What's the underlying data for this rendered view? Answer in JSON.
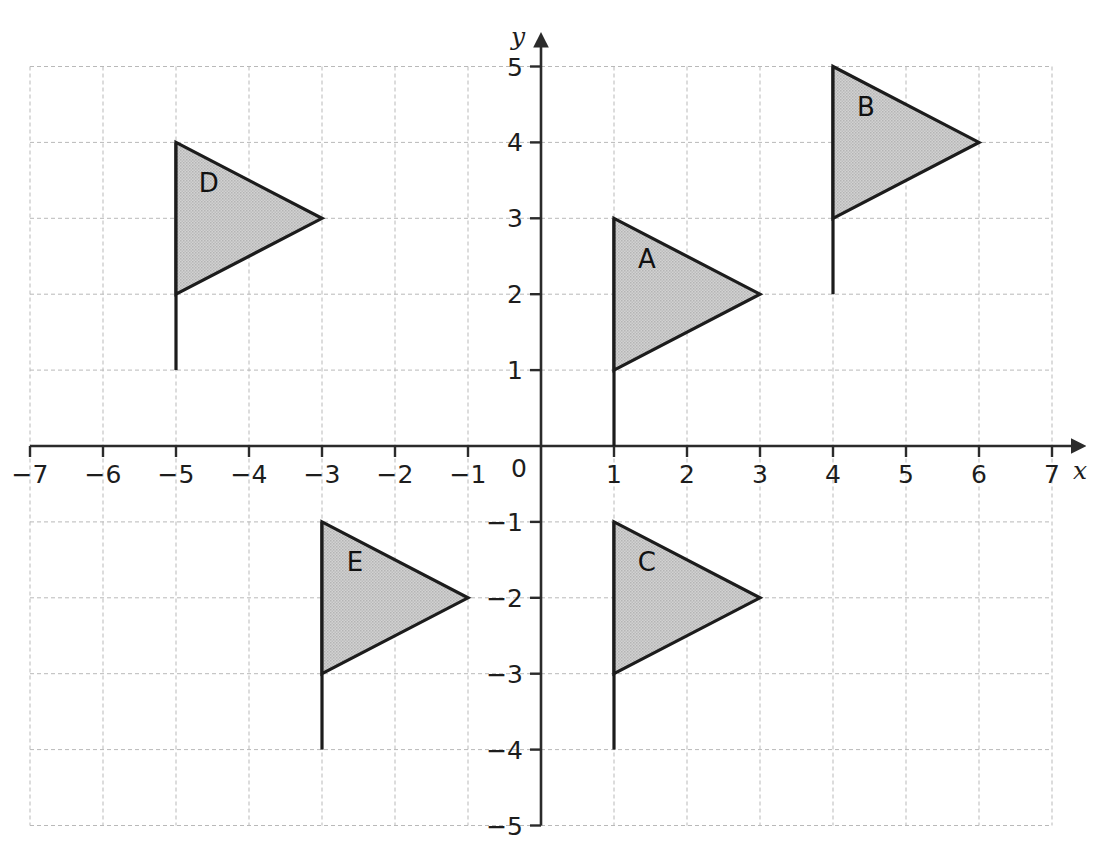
{
  "chart_data": {
    "type": "scatter",
    "title": "",
    "xlabel": "x",
    "ylabel": "y",
    "xlim": [
      -7,
      7
    ],
    "ylim": [
      -5,
      5
    ],
    "grid": true,
    "legend": "none",
    "x_ticks": [
      "−7",
      "−6",
      "−5",
      "−4",
      "−3",
      "−2",
      "−1",
      "0",
      "1",
      "2",
      "3",
      "4",
      "5",
      "6",
      "7"
    ],
    "x_tick_values": [
      -7,
      -6,
      -5,
      -4,
      -3,
      -2,
      -1,
      0,
      1,
      2,
      3,
      4,
      5,
      6,
      7
    ],
    "y_ticks": [
      "−5",
      "−4",
      "−3",
      "−2",
      "−1",
      "0",
      "1",
      "2",
      "3",
      "4",
      "5"
    ],
    "y_tick_values": [
      -5,
      -4,
      -3,
      -2,
      -1,
      0,
      1,
      2,
      3,
      4,
      5
    ],
    "origin_label": "0",
    "shapes": [
      {
        "name": "A",
        "label": "A",
        "pole": [
          [
            1,
            0
          ],
          [
            1,
            3
          ]
        ],
        "triangle": [
          [
            1,
            3
          ],
          [
            3,
            2
          ],
          [
            1,
            1
          ]
        ],
        "label_point": [
          1.45,
          2.35
        ]
      },
      {
        "name": "B",
        "label": "B",
        "pole": [
          [
            4,
            2
          ],
          [
            4,
            5
          ]
        ],
        "triangle": [
          [
            4,
            5
          ],
          [
            6,
            4
          ],
          [
            4,
            3
          ]
        ],
        "label_point": [
          4.45,
          4.35
        ]
      },
      {
        "name": "C",
        "label": "C",
        "pole": [
          [
            1,
            -4
          ],
          [
            1,
            -1
          ]
        ],
        "triangle": [
          [
            1,
            -1
          ],
          [
            3,
            -2
          ],
          [
            1,
            -3
          ]
        ],
        "label_point": [
          1.45,
          -1.65
        ]
      },
      {
        "name": "D",
        "label": "D",
        "pole": [
          [
            -5,
            1
          ],
          [
            -5,
            4
          ]
        ],
        "triangle": [
          [
            -5,
            4
          ],
          [
            -3,
            3
          ],
          [
            -5,
            2
          ]
        ],
        "label_point": [
          -4.55,
          3.35
        ]
      },
      {
        "name": "E",
        "label": "E",
        "pole": [
          [
            -3,
            -4
          ],
          [
            -3,
            -1
          ]
        ],
        "triangle": [
          [
            -3,
            -1
          ],
          [
            -1,
            -2
          ],
          [
            -3,
            -3
          ]
        ],
        "label_point": [
          -2.55,
          -1.65
        ]
      }
    ],
    "colors": {
      "fill": "#c9c9c9",
      "outline": "#1c1c1c",
      "grid": "#b9b9b9",
      "axis": "#2b2b2b",
      "background": "#ffffff"
    }
  }
}
